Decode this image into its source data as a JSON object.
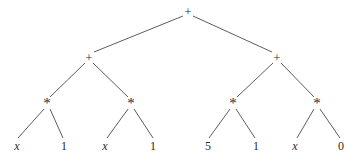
{
  "figure": {
    "name": "expression-tree",
    "background_color": "#ffffff",
    "edge_color": "#4a4a4a",
    "text_color": "#2b2b2b",
    "width": 353,
    "height": 161
  },
  "nodes": [
    {
      "id": "root",
      "label": "+",
      "kind": "operator",
      "x": 188,
      "y": 11,
      "italic": false
    },
    {
      "id": "l1",
      "label": "+",
      "kind": "operator",
      "x": 89,
      "y": 57,
      "italic": false
    },
    {
      "id": "r1",
      "label": "+",
      "kind": "operator",
      "x": 277,
      "y": 57,
      "italic": false
    },
    {
      "id": "l2a",
      "label": "*",
      "kind": "mul",
      "x": 47,
      "y": 103,
      "italic": false
    },
    {
      "id": "l2b",
      "label": "*",
      "kind": "mul",
      "x": 131,
      "y": 103,
      "italic": false
    },
    {
      "id": "r2a",
      "label": "*",
      "kind": "mul",
      "x": 233,
      "y": 103,
      "italic": false
    },
    {
      "id": "r2b",
      "label": "*",
      "kind": "mul",
      "x": 317,
      "y": 103,
      "italic": false
    },
    {
      "id": "leaf1",
      "label": "x",
      "kind": "leaf",
      "x": 17,
      "y": 146,
      "italic": true
    },
    {
      "id": "leaf2",
      "label": "1",
      "kind": "leaf",
      "x": 64,
      "y": 146,
      "italic": false
    },
    {
      "id": "leaf3",
      "label": "x",
      "kind": "leaf",
      "x": 105,
      "y": 146,
      "italic": true
    },
    {
      "id": "leaf4",
      "label": "1",
      "kind": "leaf",
      "x": 153,
      "y": 146,
      "italic": false
    },
    {
      "id": "leaf5",
      "label": "5",
      "kind": "leaf",
      "x": 208,
      "y": 146,
      "italic": false
    },
    {
      "id": "leaf6",
      "label": "1",
      "kind": "leaf",
      "x": 256,
      "y": 146,
      "italic": false
    },
    {
      "id": "leaf7",
      "label": "x",
      "kind": "leaf",
      "x": 295,
      "y": 146,
      "italic": true
    },
    {
      "id": "leaf8",
      "label": "0",
      "kind": "leaf",
      "x": 341,
      "y": 146,
      "italic": false
    }
  ],
  "edges": [
    {
      "from": "root",
      "to": "l1",
      "x1": 183,
      "y1": 16,
      "x2": 94,
      "y2": 52
    },
    {
      "from": "root",
      "to": "r1",
      "x1": 193,
      "y1": 16,
      "x2": 272,
      "y2": 52
    },
    {
      "from": "l1",
      "to": "l2a",
      "x1": 85,
      "y1": 63,
      "x2": 50,
      "y2": 97
    },
    {
      "from": "l1",
      "to": "l2b",
      "x1": 93,
      "y1": 63,
      "x2": 128,
      "y2": 97
    },
    {
      "from": "r1",
      "to": "r2a",
      "x1": 273,
      "y1": 63,
      "x2": 237,
      "y2": 97
    },
    {
      "from": "r1",
      "to": "r2b",
      "x1": 281,
      "y1": 63,
      "x2": 314,
      "y2": 97
    },
    {
      "from": "l2a",
      "to": "leaf1",
      "x1": 44,
      "y1": 109,
      "x2": 18,
      "y2": 138
    },
    {
      "from": "l2a",
      "to": "leaf2",
      "x1": 50,
      "y1": 109,
      "x2": 63,
      "y2": 138
    },
    {
      "from": "l2b",
      "to": "leaf3",
      "x1": 128,
      "y1": 109,
      "x2": 107,
      "y2": 138
    },
    {
      "from": "l2b",
      "to": "leaf4",
      "x1": 134,
      "y1": 109,
      "x2": 153,
      "y2": 138
    },
    {
      "from": "r2a",
      "to": "leaf5",
      "x1": 230,
      "y1": 109,
      "x2": 209,
      "y2": 138
    },
    {
      "from": "r2a",
      "to": "leaf6",
      "x1": 236,
      "y1": 109,
      "x2": 255,
      "y2": 138
    },
    {
      "from": "r2b",
      "to": "leaf7",
      "x1": 314,
      "y1": 109,
      "x2": 297,
      "y2": 138
    },
    {
      "from": "r2b",
      "to": "leaf8",
      "x1": 320,
      "y1": 109,
      "x2": 340,
      "y2": 138
    }
  ]
}
